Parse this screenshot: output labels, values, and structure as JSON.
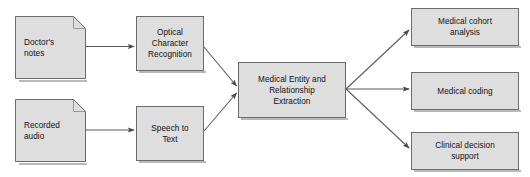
{
  "diagram": {
    "background_color": "#ffffff",
    "node_fill_color": "#dedede",
    "node_border_color": "#6b6b6b",
    "edge_color": "#5a5a5a",
    "text_color": "#111111",
    "nodes": [
      {
        "id": "doctors-notes",
        "label": "Doctor's\nnotes",
        "shape": "document"
      },
      {
        "id": "recorded-audio",
        "label": "Recorded\naudio",
        "shape": "document"
      },
      {
        "id": "optical-character-recognition",
        "label": "Optical\nCharacter\nRecognition",
        "shape": "rectangle"
      },
      {
        "id": "speech-to-text",
        "label": "Speech to\nText",
        "shape": "rectangle"
      },
      {
        "id": "medical-entity-and-relationship-extraction",
        "label": "Medical Entity and\nRelationship\nExtraction",
        "shape": "rectangle"
      },
      {
        "id": "medical-cohort-analysis",
        "label": "Medical cohort\nanalysis",
        "shape": "rectangle"
      },
      {
        "id": "medical-coding",
        "label": "Medical coding",
        "shape": "rectangle"
      },
      {
        "id": "clinical-decision-support",
        "label": "Clinical decision\nsupport",
        "shape": "rectangle"
      }
    ],
    "edges": [
      {
        "from": "doctors-notes",
        "to": "optical-character-recognition"
      },
      {
        "from": "recorded-audio",
        "to": "speech-to-text"
      },
      {
        "from": "optical-character-recognition",
        "to": "medical-entity-and-relationship-extraction"
      },
      {
        "from": "speech-to-text",
        "to": "medical-entity-and-relationship-extraction"
      },
      {
        "from": "medical-entity-and-relationship-extraction",
        "to": "medical-cohort-analysis"
      },
      {
        "from": "medical-entity-and-relationship-extraction",
        "to": "medical-coding"
      },
      {
        "from": "medical-entity-and-relationship-extraction",
        "to": "clinical-decision-support"
      }
    ]
  }
}
